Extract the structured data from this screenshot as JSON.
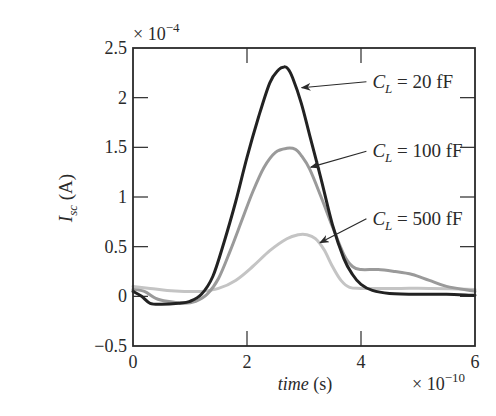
{
  "chart_data": {
    "type": "line",
    "title": "",
    "xlabel": "time (s)",
    "xlabel_italic_part": "time",
    "xlabel_unit": "(s)",
    "ylabel": "I_sc (A)",
    "ylabel_main": "I",
    "ylabel_sub": "sc",
    "ylabel_unit": "(A)",
    "x_multiplier": "× 10^-10",
    "y_multiplier": "× 10^-4",
    "xlim": [
      0,
      6
    ],
    "ylim": [
      -0.5,
      2.5
    ],
    "xticks": [
      0,
      2,
      4,
      6
    ],
    "xtick_labels": [
      "0",
      "2",
      "4",
      "6"
    ],
    "yticks": [
      -0.5,
      0,
      0.5,
      1,
      1.5,
      2,
      2.5
    ],
    "ytick_labels": [
      "−0.5",
      "0",
      "0.5",
      "1",
      "1.5",
      "2",
      "2.5"
    ],
    "grid": false,
    "legend": "annotations with arrows",
    "series": [
      {
        "name": "C_L = 20 fF",
        "label_main": "C",
        "label_sub": "L",
        "label_rest": " = 20 fF",
        "color": "#222222",
        "x": [
          0,
          0.15,
          0.3,
          0.5,
          0.8,
          1.0,
          1.2,
          1.4,
          1.6,
          1.8,
          2.0,
          2.2,
          2.4,
          2.55,
          2.65,
          2.72,
          2.8,
          2.95,
          3.1,
          3.3,
          3.5,
          3.7,
          3.85,
          4.0,
          4.2,
          4.5,
          5.0,
          5.5,
          6.0
        ],
        "y": [
          0.05,
          0.0,
          -0.07,
          -0.08,
          -0.07,
          -0.05,
          0.02,
          0.2,
          0.55,
          0.95,
          1.4,
          1.8,
          2.15,
          2.28,
          2.31,
          2.29,
          2.2,
          1.95,
          1.62,
          1.18,
          0.72,
          0.38,
          0.22,
          0.12,
          0.06,
          0.03,
          0.02,
          0.02,
          0.01
        ],
        "annotation": {
          "text_x": 4.2,
          "text_y": 2.1,
          "arrow_to_x": 2.96,
          "arrow_to_y": 2.1
        }
      },
      {
        "name": "C_L = 100 fF",
        "label_main": "C",
        "label_sub": "L",
        "label_rest": " = 100 fF",
        "color": "#9a9a9a",
        "x": [
          0,
          0.2,
          0.4,
          0.6,
          0.9,
          1.1,
          1.3,
          1.5,
          1.7,
          1.9,
          2.1,
          2.3,
          2.5,
          2.7,
          2.85,
          2.95,
          3.1,
          3.3,
          3.5,
          3.7,
          3.85,
          4.0,
          4.3,
          4.6,
          4.9,
          5.2,
          5.5,
          6.0
        ],
        "y": [
          0.07,
          0.05,
          -0.02,
          -0.05,
          -0.07,
          -0.05,
          0.02,
          0.18,
          0.45,
          0.75,
          1.05,
          1.3,
          1.45,
          1.49,
          1.48,
          1.42,
          1.28,
          1.0,
          0.7,
          0.42,
          0.3,
          0.27,
          0.27,
          0.25,
          0.22,
          0.16,
          0.1,
          0.05
        ],
        "annotation": {
          "text_x": 4.2,
          "text_y": 1.4,
          "arrow_to_x": 3.12,
          "arrow_to_y": 1.3
        }
      },
      {
        "name": "C_L = 500 fF",
        "label_main": "C",
        "label_sub": "L",
        "label_rest": " = 500 fF",
        "color": "#c4c4c4",
        "x": [
          0,
          0.3,
          0.6,
          0.9,
          1.2,
          1.5,
          1.8,
          2.1,
          2.4,
          2.7,
          2.9,
          3.05,
          3.2,
          3.35,
          3.5,
          3.65,
          3.8,
          4.0,
          4.3,
          4.7,
          5.2,
          6.0
        ],
        "y": [
          0.1,
          0.08,
          0.06,
          0.05,
          0.05,
          0.08,
          0.16,
          0.3,
          0.46,
          0.58,
          0.62,
          0.62,
          0.58,
          0.47,
          0.3,
          0.16,
          0.09,
          0.08,
          0.08,
          0.08,
          0.08,
          0.07
        ],
        "annotation": {
          "text_x": 4.2,
          "text_y": 0.72,
          "arrow_to_x": 3.28,
          "arrow_to_y": 0.54
        }
      }
    ]
  }
}
